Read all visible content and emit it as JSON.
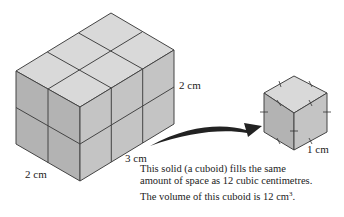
{
  "figure": {
    "large_cuboid": {
      "dimensions": {
        "width": "3 cm",
        "depth": "2 cm",
        "height": "2 cm"
      },
      "unit_cubes": 12
    },
    "unit_cube": {
      "edge_label": "1 cm"
    },
    "labels": {
      "height": "2 cm",
      "depth": "2 cm",
      "width": "3 cm",
      "unit_edge": "1 cm"
    },
    "caption": {
      "line1": "This solid (a cuboid) fills the same",
      "line2": "amount of space as 12 cubic centimetres.",
      "line3_prefix": "The volume of this cuboid is 12 cm",
      "line3_sup": "3",
      "line3_suffix": "."
    },
    "colors": {
      "top_face": "#d9d9d9",
      "left_face": "#b3b3b3",
      "right_face": "#c4c4c4",
      "edge": "#444444",
      "arrow": "#222222"
    }
  }
}
